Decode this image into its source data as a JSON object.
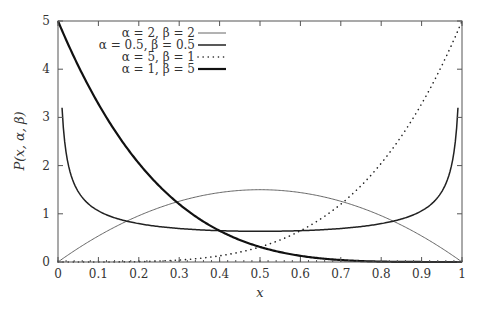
{
  "chart_data": {
    "type": "line",
    "title": "",
    "xlabel": "x",
    "ylabel": "P(x, α, β)",
    "xlim": [
      0,
      1
    ],
    "ylim": [
      0,
      5
    ],
    "grid": false,
    "legend_position": "top-center",
    "x_ticks": [
      "0",
      "0.1",
      "0.2",
      "0.3",
      "0.4",
      "0.5",
      "0.6",
      "0.7",
      "0.8",
      "0.9",
      "1"
    ],
    "y_ticks": [
      "0",
      "1",
      "2",
      "3",
      "4",
      "5"
    ],
    "series": [
      {
        "name": "α = 2, β = 2",
        "alpha": 2,
        "beta": 2,
        "style": "thin-solid",
        "x": [
          0,
          0.1,
          0.2,
          0.3,
          0.4,
          0.5,
          0.6,
          0.7,
          0.8,
          0.9,
          1
        ],
        "values": [
          0,
          0.54,
          0.96,
          1.26,
          1.44,
          1.5,
          1.44,
          1.26,
          0.96,
          0.54,
          0
        ]
      },
      {
        "name": "α = 0.5, β = 0.5",
        "alpha": 0.5,
        "beta": 0.5,
        "style": "medium-solid",
        "x": [
          0.01,
          0.05,
          0.1,
          0.2,
          0.3,
          0.4,
          0.5,
          0.6,
          0.7,
          0.8,
          0.9,
          0.95,
          0.99
        ],
        "values": [
          3.2,
          1.46,
          1.06,
          0.8,
          0.69,
          0.65,
          0.64,
          0.65,
          0.69,
          0.8,
          1.06,
          1.46,
          3.2
        ]
      },
      {
        "name": "α = 5, β = 1",
        "alpha": 5,
        "beta": 1,
        "style": "dotted",
        "x": [
          0,
          0.1,
          0.2,
          0.3,
          0.4,
          0.5,
          0.6,
          0.7,
          0.8,
          0.9,
          1
        ],
        "values": [
          0,
          0.0005,
          0.008,
          0.04,
          0.13,
          0.31,
          0.65,
          1.2,
          2.05,
          3.28,
          5
        ]
      },
      {
        "name": "α = 1, β = 5",
        "alpha": 1,
        "beta": 5,
        "style": "thick-solid",
        "x": [
          0,
          0.1,
          0.2,
          0.3,
          0.4,
          0.5,
          0.6,
          0.7,
          0.8,
          0.9,
          1
        ],
        "values": [
          5,
          3.28,
          2.05,
          1.2,
          0.65,
          0.31,
          0.13,
          0.04,
          0.008,
          0.0005,
          0
        ]
      }
    ]
  },
  "legend": {
    "items": [
      {
        "label": "α = 2, β = 2"
      },
      {
        "label": "α = 0.5, β = 0.5"
      },
      {
        "label": "α = 5, β = 1"
      },
      {
        "label": "α = 1, β = 5"
      }
    ]
  },
  "axes": {
    "xlabel": "x",
    "ylabel": "P(x, α, β)"
  }
}
